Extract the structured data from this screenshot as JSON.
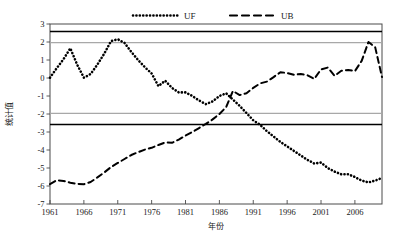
{
  "chart_data": {
    "type": "line",
    "title": "",
    "xlabel": "年份",
    "ylabel": "统计值",
    "xlim": [
      1961,
      2010
    ],
    "ylim": [
      -7,
      3
    ],
    "yticks": [
      3,
      2,
      1,
      0,
      -1,
      -2,
      -3,
      -4,
      -5,
      -6,
      -7
    ],
    "ytick_labels": [
      "3",
      "2",
      "1",
      "0",
      "-1",
      "-2",
      "-3",
      "-4",
      "-5",
      "-6",
      "-7"
    ],
    "xticks": [
      1961,
      1966,
      1971,
      1976,
      1981,
      1986,
      1991,
      1996,
      2001,
      2006
    ],
    "xtick_labels": [
      "1961",
      "1966",
      "1971",
      "1976",
      "1981",
      "1986",
      "1991",
      "1996",
      "2001",
      "2006"
    ],
    "grid": false,
    "legend_position": "top",
    "reference_lines": [
      {
        "name": "upper-001-significance",
        "value": 2.58,
        "color": "#000000",
        "style": "solid",
        "width": 1.6
      },
      {
        "name": "upper-005-significance",
        "value": 1.96,
        "color": "#a8a8a8",
        "style": "solid",
        "width": 1.2
      },
      {
        "name": "lower-005-significance",
        "value": -1.96,
        "color": "#a8a8a8",
        "style": "solid",
        "width": 1.2
      },
      {
        "name": "lower-001-significance",
        "value": -2.58,
        "color": "#000000",
        "style": "solid",
        "width": 1.6
      }
    ],
    "series": [
      {
        "name": "UF",
        "style": "dotted",
        "color": "#000000",
        "x": [
          1961,
          1962,
          1963,
          1964,
          1965,
          1966,
          1967,
          1968,
          1969,
          1970,
          1971,
          1972,
          1973,
          1974,
          1975,
          1976,
          1977,
          1978,
          1979,
          1980,
          1981,
          1982,
          1983,
          1984,
          1985,
          1986,
          1987,
          1988,
          1989,
          1990,
          1991,
          1992,
          1993,
          1994,
          1995,
          1996,
          1997,
          1998,
          1999,
          2000,
          2001,
          2002,
          2003,
          2004,
          2005,
          2006,
          2007,
          2008,
          2009,
          2010
        ],
        "values": [
          0.02,
          0.55,
          1.05,
          1.65,
          0.75,
          0.02,
          0.22,
          0.75,
          1.35,
          2.05,
          2.15,
          1.95,
          1.45,
          1.0,
          0.6,
          0.25,
          -0.45,
          -0.15,
          -0.55,
          -0.8,
          -0.8,
          -1.0,
          -1.25,
          -1.45,
          -1.3,
          -1.0,
          -0.85,
          -1.2,
          -1.55,
          -1.95,
          -2.35,
          -2.6,
          -2.95,
          -3.25,
          -3.55,
          -3.8,
          -4.05,
          -4.3,
          -4.55,
          -4.75,
          -4.7,
          -5.0,
          -5.2,
          -5.35,
          -5.35,
          -5.5,
          -5.7,
          -5.8,
          -5.7,
          -5.55
        ]
      },
      {
        "name": "UB",
        "style": "dashed",
        "color": "#000000",
        "x": [
          1961,
          1962,
          1963,
          1964,
          1965,
          1966,
          1967,
          1968,
          1969,
          1970,
          1971,
          1972,
          1973,
          1974,
          1975,
          1976,
          1977,
          1978,
          1979,
          1980,
          1981,
          1982,
          1983,
          1984,
          1985,
          1986,
          1987,
          1988,
          1989,
          1990,
          1991,
          1992,
          1993,
          1994,
          1995,
          1996,
          1997,
          1998,
          1999,
          2000,
          2001,
          2002,
          2003,
          2004,
          2005,
          2006,
          2007,
          2008,
          2009,
          2010
        ],
        "values": [
          -5.9,
          -5.68,
          -5.72,
          -5.82,
          -5.88,
          -5.9,
          -5.78,
          -5.52,
          -5.25,
          -4.95,
          -4.72,
          -4.5,
          -4.28,
          -4.12,
          -3.98,
          -3.88,
          -3.72,
          -3.58,
          -3.6,
          -3.42,
          -3.2,
          -3.0,
          -2.78,
          -2.55,
          -2.3,
          -2.0,
          -1.62,
          -0.72,
          -0.95,
          -0.85,
          -0.55,
          -0.3,
          -0.2,
          0.05,
          0.32,
          0.28,
          0.18,
          0.22,
          0.15,
          -0.05,
          0.48,
          0.58,
          0.12,
          0.4,
          0.45,
          0.38,
          0.95,
          2.0,
          1.7,
          0.05
        ]
      }
    ]
  },
  "legend": {
    "items": [
      {
        "label": "UF",
        "style": "dotted"
      },
      {
        "label": "UB",
        "style": "dashed"
      }
    ]
  }
}
